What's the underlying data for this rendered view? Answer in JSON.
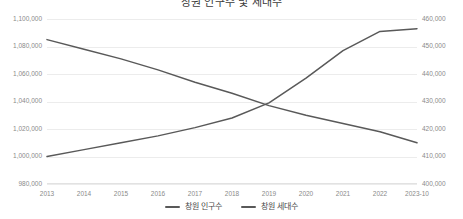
{
  "chart_data": {
    "type": "line",
    "title": "창원 인구수 및 세대수",
    "xlabel": "",
    "ylabel": "",
    "grid": true,
    "legend_position": "bottom",
    "categories": [
      "2013",
      "2014",
      "2015",
      "2016",
      "2017",
      "2018",
      "2019",
      "2020",
      "2021",
      "2022",
      "2023-10"
    ],
    "axes": {
      "left": {
        "label": "창원 인구수",
        "min": 980000,
        "max": 1100000,
        "step": 20000,
        "ticks": [
          "980,000",
          "1,000,000",
          "1,020,000",
          "1,040,000",
          "1,060,000",
          "1,080,000",
          "1,100,000"
        ],
        "tick_values": [
          980000,
          1000000,
          1020000,
          1040000,
          1060000,
          1080000,
          1100000
        ]
      },
      "right": {
        "label": "창원 세대수",
        "min": 400000,
        "max": 460000,
        "step": 10000,
        "ticks": [
          "400,000",
          "410,000",
          "420,000",
          "430,000",
          "440,000",
          "450,000",
          "460,000"
        ],
        "tick_values": [
          400000,
          410000,
          420000,
          430000,
          440000,
          450000,
          460000
        ]
      }
    },
    "series": [
      {
        "name": "창원 인구수",
        "axis": "left",
        "color": "#595959",
        "values": [
          1085000,
          1078000,
          1071000,
          1063000,
          1054000,
          1046000,
          1037000,
          1030000,
          1024000,
          1018000,
          1010000
        ]
      },
      {
        "name": "창원 세대수",
        "axis": "right",
        "color": "#595959",
        "values": [
          410000,
          412500,
          415000,
          417500,
          420500,
          424000,
          429500,
          438500,
          448500,
          455500,
          456500
        ]
      }
    ]
  },
  "legend": {
    "items": [
      {
        "label": "창원 인구수",
        "color": "#595959"
      },
      {
        "label": "창원 세대수",
        "color": "#595959"
      }
    ]
  }
}
